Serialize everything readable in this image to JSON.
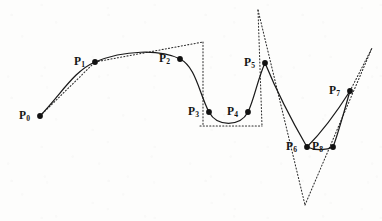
{
  "figure": {
    "background_color": "#fdfdfc",
    "curve_color": "#1a1a1a",
    "polygon_color": "#2b2b2b",
    "dot_color": "#121212",
    "width": 382,
    "height": 221
  },
  "chart_data": {
    "type": "scatter",
    "title": "",
    "xlabel": "",
    "ylabel": "",
    "grid": false,
    "legend": false,
    "xlim": [
      0,
      382
    ],
    "ylim": [
      221,
      0
    ],
    "points": [
      {
        "name": "P0",
        "label": "P",
        "subscript": "0",
        "x": 40,
        "y": 116,
        "label_x": 19,
        "label_y": 110
      },
      {
        "name": "P1",
        "label": "P",
        "subscript": "1",
        "x": 95,
        "y": 62,
        "label_x": 74,
        "label_y": 56
      },
      {
        "name": "P2",
        "label": "P",
        "subscript": "2",
        "x": 180,
        "y": 59,
        "label_x": 159,
        "label_y": 53
      },
      {
        "name": "P3",
        "label": "P",
        "subscript": "3",
        "x": 209,
        "y": 112,
        "label_x": 188,
        "label_y": 106
      },
      {
        "name": "P4",
        "label": "P",
        "subscript": "4",
        "x": 248,
        "y": 112,
        "label_x": 227,
        "label_y": 106
      },
      {
        "name": "P5",
        "label": "P",
        "subscript": "5",
        "x": 265,
        "y": 63,
        "label_x": 244,
        "label_y": 57
      },
      {
        "name": "P6",
        "label": "P",
        "subscript": "6",
        "x": 307,
        "y": 147,
        "label_x": 286,
        "label_y": 141
      },
      {
        "name": "P7",
        "label": "P",
        "subscript": "7",
        "x": 350,
        "y": 91,
        "label_x": 329,
        "label_y": 85
      },
      {
        "name": "P8",
        "label": "P",
        "subscript": "8",
        "x": 333,
        "y": 147,
        "label_x": 312,
        "label_y": 141
      }
    ],
    "curve_segments": [
      {
        "name": "segment-p0-p2",
        "path": "M40,116 C62,93 74,71 95,62 C124,50 160,49 180,59"
      },
      {
        "name": "segment-p2-p4",
        "path": "M180,59 C196,67 199,93 209,112 C217,127 240,127 248,112"
      },
      {
        "name": "segment-p4-p5",
        "path": "M248,112 C254,100 258,78 265,63"
      },
      {
        "name": "segment-p5-p6",
        "path": "M265,63 C277,92 296,128 307,147"
      },
      {
        "name": "segment-p6-p8",
        "path": "M307,147 C316,151 327,150 333,147"
      },
      {
        "name": "segment-p8-p7",
        "path": "M333,147 C339,131 345,108 350,91"
      },
      {
        "name": "segment-p6-p7-outer",
        "path": "M307,147 C320,134 338,110 350,91"
      }
    ],
    "polygon_segments": [
      {
        "name": "poly-p0-p1",
        "path": "M40,116 L95,62"
      },
      {
        "name": "poly-p1-top-right",
        "path": "M95,62 L203,42"
      },
      {
        "name": "poly-top-down",
        "path": "M203,42 L203,126"
      },
      {
        "name": "poly-bottom",
        "path": "M200,126 L262,126"
      },
      {
        "name": "poly-p5-left-up",
        "path": "M258,10 L262,126"
      },
      {
        "name": "poly-p5-right-down",
        "path": "M258,10 L305,205"
      },
      {
        "name": "poly-v-right-up",
        "path": "M305,205 L372,48"
      },
      {
        "name": "poly-p7-stub",
        "path": "M350,91 L372,48"
      }
    ]
  }
}
